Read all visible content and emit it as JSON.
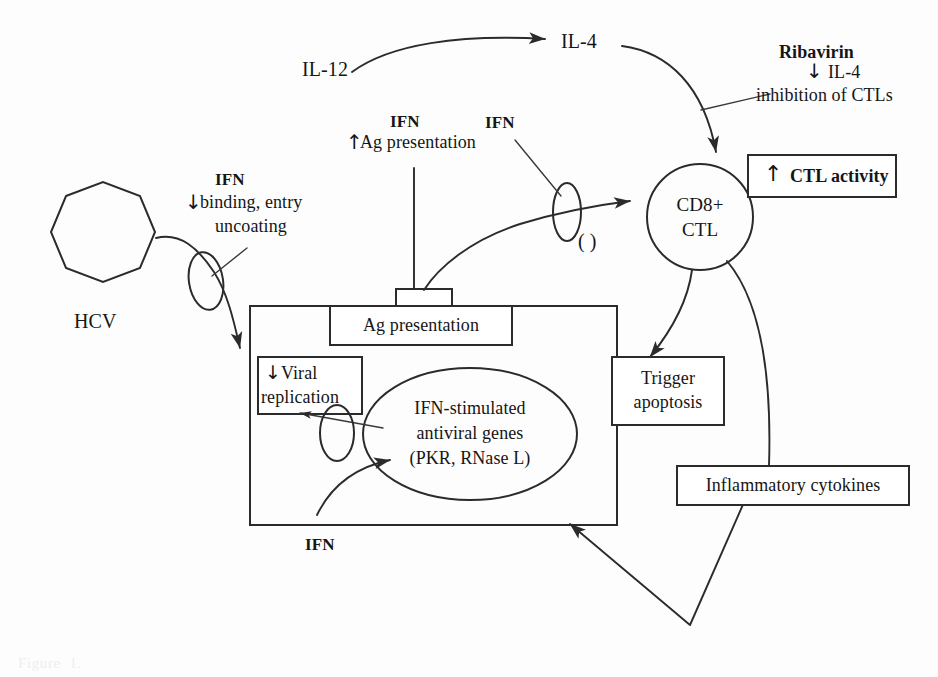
{
  "figure": {
    "type": "biological-pathway-diagram",
    "ink_color": "#2b2b2b",
    "background_color": "#ffffff"
  },
  "nodes": {
    "hcv": {
      "label": "HCV",
      "shape": "octagon"
    },
    "cd8_ctl": {
      "label_line1": "CD8+",
      "label_line2": "CTL",
      "shape": "circle"
    },
    "antiviral_genes": {
      "line1": "IFN-stimulated",
      "line2": "antiviral genes",
      "line3": "(PKR, RNase L)",
      "shape": "ellipse"
    },
    "cell": {
      "shape": "rectangle",
      "role": "hepatocyte"
    },
    "mhc_stalk": {
      "shape": "small-rectangle",
      "role": "antigen-presenting-molecule"
    }
  },
  "boxes": {
    "ag_presentation": {
      "label": "Ag presentation"
    },
    "viral_replication": {
      "arrow": "↓",
      "line1": "Viral",
      "line2": "replication"
    },
    "trigger_apoptosis": {
      "line1": "Trigger",
      "line2": "apoptosis"
    },
    "inflammatory_cytokines": {
      "label": "Inflammatory cytokines"
    },
    "ctl_activity": {
      "arrow": "↑",
      "label": "CTL activity"
    }
  },
  "labels": {
    "il12": "IL-12",
    "il4_top": "IL-4",
    "ifn_binding_title": "IFN",
    "ifn_binding_arrow": "↓",
    "ifn_binding_line1": "binding, entry",
    "ifn_binding_line2": "uncoating",
    "ifn_ag_title": "IFN",
    "ifn_ag_arrow": "↑",
    "ifn_ag_text": "Ag presentation",
    "ifn_ctl": "IFN",
    "ifn_bottom": "IFN",
    "parens": "( )",
    "ribavirin_title": "Ribavirin",
    "ribavirin_arrow": "↓",
    "ribavirin_il4": "IL-4",
    "ribavirin_effect": "inhibition of CTLs"
  },
  "caption": {
    "text": "Figure  1."
  }
}
